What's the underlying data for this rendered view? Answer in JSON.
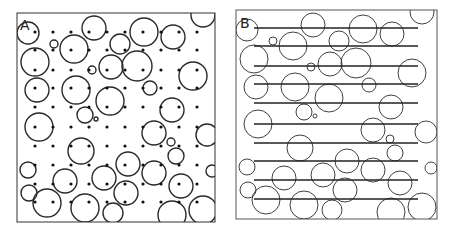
{
  "figure": {
    "stroke_color": "#2a2a2a",
    "background": "#ffffff"
  },
  "panels": [
    {
      "id": "A",
      "label": "A",
      "method": "point-grid",
      "frame": {
        "x": 17,
        "y": 13,
        "w": 198,
        "h": 209
      },
      "grid": {
        "xs": [
          35,
          53,
          71,
          89,
          107,
          125,
          143,
          161,
          179,
          197
        ],
        "ys": [
          32,
          50,
          70,
          88,
          107,
          127,
          146,
          165,
          184,
          202
        ],
        "dot_radius": 1.6
      },
      "circle_offset": {
        "dx": 0,
        "dy": 0
      }
    },
    {
      "id": "B",
      "label": "B",
      "method": "line-transects",
      "frame": {
        "x": 236,
        "y": 10,
        "w": 201,
        "h": 209
      },
      "lines": {
        "x1": 254,
        "x2": 418,
        "ys": [
          28,
          46,
          66,
          84,
          103,
          124,
          143,
          161,
          180,
          199
        ]
      },
      "circle_offset": {
        "dx": 219,
        "dy": -3
      }
    }
  ],
  "circles": [
    [
      28,
      33,
      11
    ],
    [
      54,
      44,
      4
    ],
    [
      94,
      28,
      12
    ],
    [
      74,
      49,
      14
    ],
    [
      35,
      62,
      14
    ],
    [
      120,
      44,
      10
    ],
    [
      144,
      32,
      14
    ],
    [
      173,
      37,
      12
    ],
    [
      203,
      15,
      12
    ],
    [
      92,
      70,
      4
    ],
    [
      111,
      67,
      12
    ],
    [
      137,
      66,
      15
    ],
    [
      193,
      76,
      14
    ],
    [
      37,
      90,
      12
    ],
    [
      76,
      90,
      14
    ],
    [
      110,
      101,
      14
    ],
    [
      150,
      88,
      7
    ],
    [
      172,
      110,
      12
    ],
    [
      85,
      115,
      8
    ],
    [
      96,
      119,
      2
    ],
    [
      39,
      127,
      14
    ],
    [
      154,
      133,
      12
    ],
    [
      171,
      142,
      4
    ],
    [
      207,
      135,
      11
    ],
    [
      81,
      151,
      13
    ],
    [
      176,
      156,
      8
    ],
    [
      28,
      170,
      8
    ],
    [
      128,
      164,
      12
    ],
    [
      154,
      173,
      12
    ],
    [
      65,
      181,
      12
    ],
    [
      104,
      178,
      12
    ],
    [
      29,
      193,
      8
    ],
    [
      47,
      203,
      14
    ],
    [
      126,
      193,
      12
    ],
    [
      181,
      186,
      12
    ],
    [
      85,
      208,
      14
    ],
    [
      113,
      213,
      10
    ],
    [
      172,
      215,
      14
    ],
    [
      203,
      210,
      14
    ],
    [
      212,
      171,
      6
    ]
  ]
}
